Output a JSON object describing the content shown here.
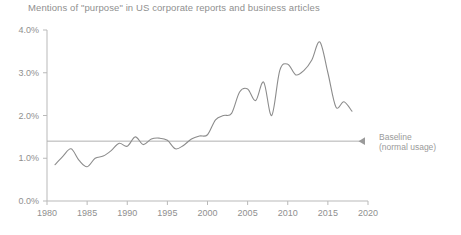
{
  "chart_data": {
    "type": "line",
    "title": "Mentions of \"purpose\" in US corporate reports and business articles",
    "xlabel": "",
    "ylabel": "",
    "xlim": [
      1980,
      2020
    ],
    "ylim": [
      0.0,
      4.0
    ],
    "grid": false,
    "legend": null,
    "x_ticks": [
      "1980",
      "1985",
      "1990",
      "1995",
      "2000",
      "2005",
      "2010",
      "2015",
      "2020"
    ],
    "x_tick_values": [
      1980,
      1985,
      1990,
      1995,
      2000,
      2005,
      2010,
      2015,
      2020
    ],
    "y_ticks": [
      "0.0%",
      "1.0%",
      "2.0%",
      "3.0%",
      "4.0%"
    ],
    "y_tick_values": [
      0.0,
      1.0,
      2.0,
      3.0,
      4.0
    ],
    "series": [
      {
        "name": "Mentions of \"purpose\"",
        "color": "#8c8c8c",
        "x": [
          1981,
          1982,
          1983,
          1984,
          1985,
          1986,
          1987,
          1988,
          1989,
          1990,
          1991,
          1992,
          1993,
          1994,
          1995,
          1996,
          1997,
          1998,
          1999,
          2000,
          2001,
          2002,
          2003,
          2004,
          2005,
          2006,
          2007,
          2008,
          2009,
          2010,
          2011,
          2012,
          2013,
          2014,
          2015,
          2016,
          2017,
          2018
        ],
        "values": [
          0.85,
          1.05,
          1.22,
          0.95,
          0.8,
          1.0,
          1.05,
          1.18,
          1.35,
          1.28,
          1.5,
          1.32,
          1.45,
          1.47,
          1.42,
          1.22,
          1.3,
          1.45,
          1.52,
          1.55,
          1.9,
          2.0,
          2.05,
          2.55,
          2.62,
          2.35,
          2.78,
          2.0,
          3.05,
          3.2,
          2.95,
          3.05,
          3.3,
          3.72,
          3.0,
          2.2,
          2.32,
          2.1
        ]
      }
    ],
    "annotations": [
      {
        "name": "baseline",
        "label_line1": "Baseline",
        "label_line2": "(normal usage)",
        "value": 1.4,
        "color": "#9a9a9a"
      }
    ]
  },
  "colors": {
    "background": "#ffffff",
    "text": "#8f8f8f",
    "axis": "#b9b9b9",
    "line": "#8c8c8c",
    "baseline": "#b0b0b0"
  }
}
